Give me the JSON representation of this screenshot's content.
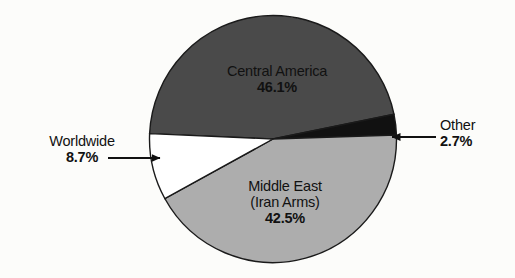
{
  "chart_data": {
    "type": "pie",
    "title": "",
    "subtitle": "",
    "xlabel": "",
    "ylabel": "",
    "legend_position": "none",
    "grid": false,
    "total": 100.0,
    "categories": [
      "Central America",
      "Other",
      "Middle East (Iran Arms)",
      "Worldwide"
    ],
    "values": [
      46.1,
      2.7,
      42.5,
      8.7
    ],
    "slices": [
      {
        "label": "Central America",
        "label_line1": "Central America",
        "label_line2": "",
        "value": 46.1,
        "value_text": "46.1%",
        "color": "#4a4a4a",
        "label_placement": "inside",
        "callout": false
      },
      {
        "label": "Other",
        "label_line1": "Other",
        "label_line2": "",
        "value": 2.7,
        "value_text": "2.7%",
        "color": "#111111",
        "label_placement": "outside-right",
        "callout": true,
        "callout_direction": "left"
      },
      {
        "label": "Middle East (Iran Arms)",
        "label_line1": "Middle East",
        "label_line2": "(Iran Arms)",
        "value": 42.5,
        "value_text": "42.5%",
        "color": "#adadad",
        "label_placement": "inside",
        "callout": false
      },
      {
        "label": "Worldwide",
        "label_line1": "Worldwide",
        "label_line2": "",
        "value": 8.7,
        "value_text": "8.7%",
        "color": "#ffffff",
        "label_placement": "outside-left",
        "callout": true,
        "callout_direction": "right"
      }
    ]
  },
  "colors": {
    "background": "#fcfcfa",
    "outline": "#1a1a1a",
    "text": "#111111",
    "central_america": "#4a4a4a",
    "middle_east": "#adadad",
    "other": "#111111",
    "worldwide": "#ffffff"
  },
  "labels": {
    "central_america": {
      "name": "Central America",
      "pct": "46.1%"
    },
    "middle_east": {
      "name_line1": "Middle East",
      "name_line2": "(Iran Arms)",
      "pct": "42.5%"
    },
    "worldwide": {
      "name": "Worldwide",
      "pct": "8.7%"
    },
    "other": {
      "name": "Other",
      "pct": "2.7%"
    }
  },
  "icons": {
    "worldwide_callout": "arrow-right-icon",
    "other_callout": "arrow-left-icon"
  }
}
